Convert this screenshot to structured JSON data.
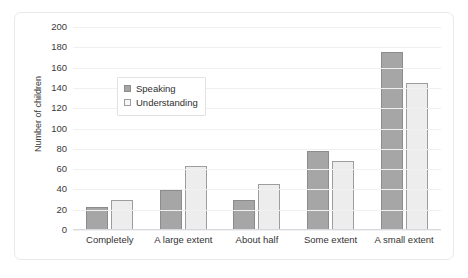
{
  "chart_data": {
    "type": "bar",
    "title": "",
    "xlabel": "",
    "ylabel": "Number of children",
    "ylim": [
      0,
      200
    ],
    "ytick_step": 20,
    "yticks": [
      200,
      180,
      160,
      140,
      120,
      100,
      80,
      60,
      40,
      20,
      0
    ],
    "grid": true,
    "legend_position": "upper-left-inside",
    "categories": [
      "Completely",
      "A large extent",
      "About half",
      "Some extent",
      "A small extent"
    ],
    "series": [
      {
        "name": "Speaking",
        "color": "#a6a6a6",
        "border": "#8c8c8c",
        "values": [
          23,
          39,
          30,
          78,
          175
        ]
      },
      {
        "name": "Understanding",
        "color": "#ededed",
        "border": "#9d9d9d",
        "values": [
          30,
          63,
          45,
          68,
          145
        ]
      }
    ]
  },
  "legend": {
    "items": [
      {
        "label": "Speaking"
      },
      {
        "label": "Understanding"
      }
    ]
  },
  "axes": {
    "y_label": "Number of children"
  },
  "colors": {
    "speaking_fill": "#a6a6a6",
    "speaking_border": "#8c8c8c",
    "understanding_fill": "#ededed",
    "understanding_border": "#9d9d9d",
    "gridline": "#f0f0f2",
    "frame_border": "#e9e9ec",
    "text": "#333333"
  }
}
